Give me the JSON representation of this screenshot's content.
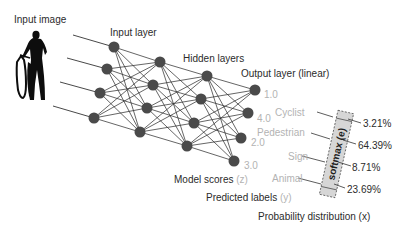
{
  "title_labels": {
    "input_image": "Input image",
    "input_layer": "Input layer",
    "hidden_layers": "Hidden layers",
    "output_layer": "Output layer (linear)"
  },
  "scores": [
    "1.0",
    "4.0",
    "2.0",
    "3.0"
  ],
  "softmax": {
    "label": "softmax (e)",
    "classes": [
      "Cyclist",
      "Pedestrian",
      "Sign",
      "Animal"
    ],
    "probabilities": [
      "3.21%",
      "64.39%",
      "8.71%",
      "23.69%"
    ]
  },
  "bottom_labels": {
    "model_scores": "Model scores",
    "model_scores_var": "(z)",
    "predicted_labels": "Predicted labels",
    "predicted_labels_var": "(y)",
    "probability_distribution": "Probability distribution (x)"
  },
  "network": {
    "layers": [
      {
        "name": "input",
        "nodes": [
          [
            114,
            47
          ],
          [
            107,
            69
          ],
          [
            100,
            93
          ],
          [
            94,
            118
          ]
        ]
      },
      {
        "name": "hidden-1",
        "nodes": [
          [
            160,
            62
          ],
          [
            153,
            85
          ],
          [
            147,
            108
          ],
          [
            140,
            132
          ]
        ]
      },
      {
        "name": "hidden-2",
        "nodes": [
          [
            207,
            76
          ],
          [
            201,
            99
          ],
          [
            194,
            123
          ],
          [
            187,
            146
          ]
        ]
      },
      {
        "name": "output",
        "nodes": [
          [
            255,
            90
          ],
          [
            248,
            113
          ],
          [
            241,
            138
          ],
          [
            234,
            161
          ]
        ]
      }
    ],
    "input_line_starts": [
      [
        73,
        35
      ],
      [
        67,
        58
      ],
      [
        60,
        82
      ],
      [
        53,
        106
      ]
    ]
  },
  "colors": {
    "node": "#4a4a4a",
    "edge": "#333333",
    "light_text": "#b3b3b3",
    "dark_text": "#2b2b2b",
    "softmax_fill": "#d9d9d9"
  }
}
